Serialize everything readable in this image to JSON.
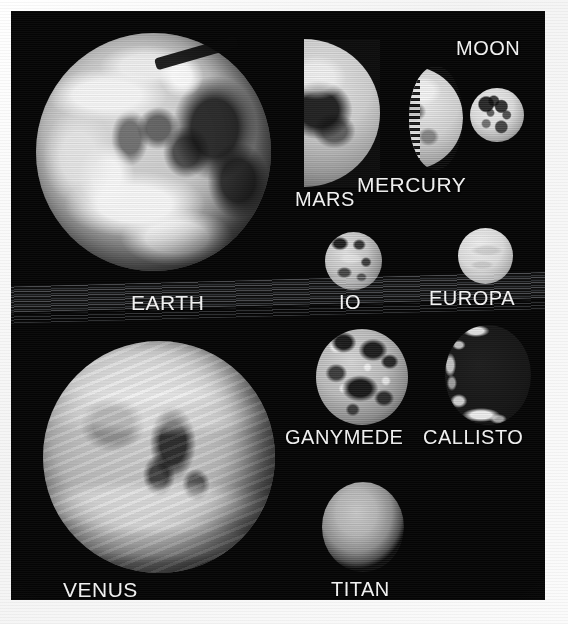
{
  "figure": {
    "kind": "comparative-scale-montage",
    "medium": "grayscale scanned photo plate",
    "background_color": "#050505",
    "border_color": "#ffffff",
    "label_color": "#f2f2f2",
    "artifacts": [
      "horizontal-scan-lines",
      "tilted-bright-scanline-band"
    ]
  },
  "bodies": [
    {
      "label": "EARTH",
      "appearance": "full disk, bright swirling cloud systems over dark oceans",
      "phase": "full",
      "relative_size": "largest",
      "group": "planet"
    },
    {
      "label": "MARS",
      "appearance": "half disk, flat terminator on left, large dark albedo patch",
      "phase": "half",
      "relative_size": "medium",
      "group": "planet"
    },
    {
      "label": "MERCURY",
      "appearance": "half disk, rough cratered terminator on left",
      "phase": "half",
      "relative_size": "small",
      "group": "planet"
    },
    {
      "label": "MOON",
      "appearance": "full disk, dark maria and bright highlands",
      "phase": "full",
      "relative_size": "small",
      "group": "moon"
    },
    {
      "label": "IO",
      "appearance": "small mottled disk, bright and dark blotches",
      "phase": "full",
      "relative_size": "small",
      "group": "moon"
    },
    {
      "label": "EUROPA",
      "appearance": "small smooth bright disk, few markings",
      "phase": "full",
      "relative_size": "small",
      "group": "moon"
    },
    {
      "label": "GANYMEDE",
      "appearance": "heavily mottled disk, bright ray craters and dark terrain",
      "phase": "full",
      "relative_size": "medium",
      "group": "moon"
    },
    {
      "label": "CALLISTO",
      "appearance": "very dark disk, thin bright crescent along left limb",
      "phase": "crescent",
      "relative_size": "medium",
      "group": "moon"
    },
    {
      "label": "VENUS",
      "appearance": "full disk, soft banded cloud swirls, featureless dark spots",
      "phase": "full",
      "relative_size": "largest",
      "group": "planet"
    },
    {
      "label": "TITAN",
      "appearance": "soft hazy featureless disk, slightly elliptical",
      "phase": "full",
      "relative_size": "medium",
      "group": "moon"
    }
  ]
}
